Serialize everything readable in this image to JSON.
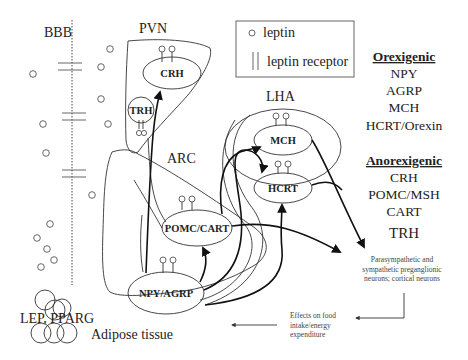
{
  "diagram": {
    "regions": {
      "bbb": "BBB",
      "pvn": "PVN",
      "arc": "ARC",
      "lha": "LHA"
    },
    "nuclei": {
      "crh": "CRH",
      "trh": "TRH",
      "mch": "MCH",
      "hcrt": "HCRT",
      "pomc_cart": "POMC/CART",
      "npy_agrp": "NPY/AGRP"
    },
    "legend": {
      "leptin": "leptin",
      "leptin_receptor": "leptin receptor"
    },
    "orexigenic": {
      "heading": "Orexigenic",
      "items": [
        "NPY",
        "AGRP",
        "MCH",
        "HCRT/Orexin"
      ]
    },
    "anorexigenic": {
      "heading": "Anorexigenic",
      "items": [
        "CRH",
        "POMC/MSH",
        "CART",
        "TRH"
      ]
    },
    "outputs": {
      "neurons": [
        "Parasympathetic and",
        "sympathetic preganglionic",
        "neurons; cortical neurons"
      ],
      "effects": [
        "Effects on food",
        "intake/energy",
        "expenditure"
      ]
    },
    "adipose": {
      "genes": "LEP, PPARG",
      "label": "Adipose tissue"
    }
  }
}
